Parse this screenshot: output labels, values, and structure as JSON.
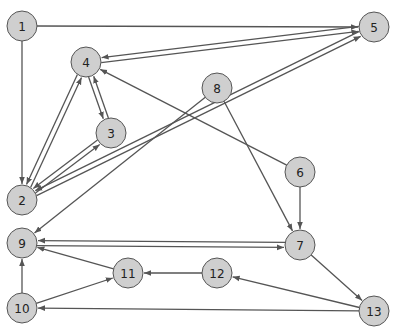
{
  "diagram": {
    "type": "directed-graph",
    "node_radius": 15,
    "colors": {
      "node_fill": "#cfcfcf",
      "node_stroke": "#555555",
      "edge": "#555555",
      "background": "#ffffff"
    },
    "nodes": [
      {
        "id": "1",
        "label": "1",
        "x": 22,
        "y": 26
      },
      {
        "id": "2",
        "label": "2",
        "x": 22,
        "y": 200
      },
      {
        "id": "3",
        "label": "3",
        "x": 111,
        "y": 133
      },
      {
        "id": "4",
        "label": "4",
        "x": 86,
        "y": 62
      },
      {
        "id": "5",
        "label": "5",
        "x": 374,
        "y": 27
      },
      {
        "id": "6",
        "label": "6",
        "x": 300,
        "y": 172
      },
      {
        "id": "7",
        "label": "7",
        "x": 300,
        "y": 245
      },
      {
        "id": "8",
        "label": "8",
        "x": 217,
        "y": 88
      },
      {
        "id": "9",
        "label": "9",
        "x": 22,
        "y": 243
      },
      {
        "id": "10",
        "label": "10",
        "x": 22,
        "y": 308
      },
      {
        "id": "11",
        "label": "11",
        "x": 128,
        "y": 273
      },
      {
        "id": "12",
        "label": "12",
        "x": 217,
        "y": 273
      },
      {
        "id": "13",
        "label": "13",
        "x": 374,
        "y": 311
      }
    ],
    "edges": [
      {
        "from": "1",
        "to": "5"
      },
      {
        "from": "1",
        "to": "2"
      },
      {
        "from": "4",
        "to": "5"
      },
      {
        "from": "5",
        "to": "4"
      },
      {
        "from": "4",
        "to": "3"
      },
      {
        "from": "3",
        "to": "4"
      },
      {
        "from": "2",
        "to": "4"
      },
      {
        "from": "4",
        "to": "2"
      },
      {
        "from": "2",
        "to": "3"
      },
      {
        "from": "3",
        "to": "2"
      },
      {
        "from": "2",
        "to": "5"
      },
      {
        "from": "5",
        "to": "2"
      },
      {
        "from": "6",
        "to": "4"
      },
      {
        "from": "8",
        "to": "9"
      },
      {
        "from": "8",
        "to": "7"
      },
      {
        "from": "6",
        "to": "7"
      },
      {
        "from": "9",
        "to": "7"
      },
      {
        "from": "7",
        "to": "9"
      },
      {
        "from": "11",
        "to": "9"
      },
      {
        "from": "10",
        "to": "9"
      },
      {
        "from": "10",
        "to": "11"
      },
      {
        "from": "12",
        "to": "11"
      },
      {
        "from": "7",
        "to": "13"
      },
      {
        "from": "13",
        "to": "12"
      },
      {
        "from": "13",
        "to": "10"
      }
    ]
  }
}
